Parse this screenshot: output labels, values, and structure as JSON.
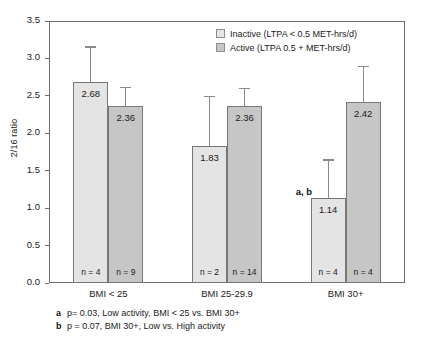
{
  "chart_data": {
    "type": "bar",
    "title": "",
    "xlabel": "",
    "ylabel": "2/16 ratio",
    "ylim": [
      0.0,
      3.5
    ],
    "ytick_labels": [
      "0.0",
      "0.5",
      "1.0",
      "1.5",
      "2.0",
      "2.5",
      "3.0",
      "3.5"
    ],
    "ytick_values": [
      0.0,
      0.5,
      1.0,
      1.5,
      2.0,
      2.5,
      3.0,
      3.5
    ],
    "grid": false,
    "legend_position": "top-right",
    "categories": [
      "BMI < 25",
      "BMI 25-29.9",
      "BMI 30+"
    ],
    "series": [
      {
        "name": "Inactive (LTPA < 0.5 MET-hrs/d)",
        "color": "#e4e4e4",
        "values": [
          2.68,
          1.83,
          1.14
        ],
        "value_labels": [
          "2.68",
          "1.83",
          "1.14"
        ],
        "n_labels": [
          "n = 4",
          "n = 2",
          "n = 4"
        ],
        "error_upper": [
          3.16,
          2.5,
          1.65
        ]
      },
      {
        "name": "Active (LTPA 0.5 + MET-hrs/d)",
        "color": "#c6c6c6",
        "values": [
          2.36,
          2.36,
          2.42
        ],
        "value_labels": [
          "2.36",
          "2.36",
          "2.42"
        ],
        "n_labels": [
          "n = 9",
          "n = 14",
          "n = 4"
        ],
        "error_upper": [
          2.62,
          2.61,
          2.9
        ]
      }
    ],
    "annotations": [
      {
        "text": "a, b",
        "series": 0,
        "category": 2
      }
    ]
  },
  "legend": {
    "items": [
      {
        "label": "Inactive (LTPA < 0.5 MET-hrs/d)",
        "swatch": "inactive"
      },
      {
        "label": "Active (LTPA 0.5 + MET-hrs/d)",
        "swatch": "active"
      }
    ]
  },
  "footnotes": [
    {
      "key": "a",
      "text": "p= 0.03, Low activity, BMI < 25 vs. BMI 30+"
    },
    {
      "key": "b",
      "text": "p = 0.07, BMI 30+, Low vs. High activity"
    }
  ]
}
